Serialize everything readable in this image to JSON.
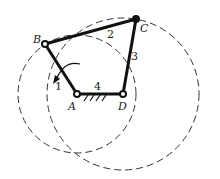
{
  "diagram": {
    "type": "four-bar linkage",
    "joints": {
      "A": {
        "label": "A",
        "x": 77,
        "y": 94
      },
      "B": {
        "label": "B",
        "x": 45,
        "y": 44
      },
      "C": {
        "label": "C",
        "x": 136,
        "y": 19
      },
      "D": {
        "label": "D",
        "x": 123,
        "y": 94
      }
    },
    "links": [
      {
        "id": "1",
        "label": "1",
        "from": "A",
        "to": "B"
      },
      {
        "id": "2",
        "label": "2",
        "from": "B",
        "to": "C"
      },
      {
        "id": "3",
        "label": "3",
        "from": "C",
        "to": "D"
      },
      {
        "id": "4",
        "label": "4",
        "from": "A",
        "to": "D",
        "ground": true
      }
    ],
    "circles": [
      {
        "name": "trajectory-circle-B",
        "center": "A",
        "radius": 59
      },
      {
        "name": "trajectory-circle-C",
        "center": "D",
        "radius": 76
      }
    ],
    "rotation_arrow": {
      "on_link": "1",
      "direction": "counterclockwise"
    },
    "colors": {
      "line": "#111111",
      "dashed": "#333333",
      "background": "#ffffff"
    }
  }
}
